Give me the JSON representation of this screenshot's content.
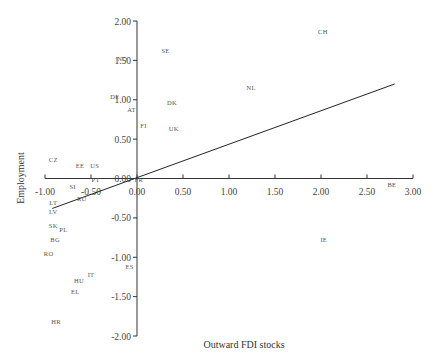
{
  "chart_data": {
    "type": "scatter",
    "title": "",
    "xlabel": "Outward FDI stocks",
    "ylabel": "Employment",
    "xlim": [
      -1.0,
      3.0
    ],
    "ylim": [
      -2.0,
      2.0
    ],
    "grid": false,
    "legend": "none",
    "x_ticks": [
      "-1.00",
      "-0.50",
      "0.00",
      "0.50",
      "1.00",
      "1.50",
      "2.00",
      "2.50",
      "3.00"
    ],
    "y_ticks": [
      "2.00",
      "1.50",
      "1.00",
      "0.50",
      "0.00",
      "-0.50",
      "-1.00",
      "-1.50",
      "-2.00"
    ],
    "points": [
      {
        "label": "CH",
        "x": 2.02,
        "y": 1.87
      },
      {
        "label": "SE",
        "x": 0.31,
        "y": 1.62
      },
      {
        "label": "NO",
        "x": -0.16,
        "y": 1.53
      },
      {
        "label": "NL",
        "x": 1.24,
        "y": 1.15
      },
      {
        "label": "DE",
        "x": -0.24,
        "y": 1.04
      },
      {
        "label": "DK",
        "x": 0.38,
        "y": 0.96
      },
      {
        "label": "AT",
        "x": -0.06,
        "y": 0.88
      },
      {
        "label": "FI",
        "x": 0.07,
        "y": 0.67
      },
      {
        "label": "UK",
        "x": 0.4,
        "y": 0.64
      },
      {
        "label": "CZ",
        "x": -0.91,
        "y": 0.24
      },
      {
        "label": "EE",
        "x": -0.62,
        "y": 0.17
      },
      {
        "label": "US",
        "x": -0.46,
        "y": 0.17
      },
      {
        "label": "PT",
        "x": -0.45,
        "y": -0.01
      },
      {
        "label": "FR",
        "x": 0.02,
        "y": -0.01
      },
      {
        "label": "SI",
        "x": -0.7,
        "y": -0.1
      },
      {
        "label": "RU",
        "x": -0.6,
        "y": -0.25
      },
      {
        "label": "LT",
        "x": -0.91,
        "y": -0.3
      },
      {
        "label": "LV",
        "x": -0.91,
        "y": -0.42
      },
      {
        "label": "SK",
        "x": -0.91,
        "y": -0.6
      },
      {
        "label": "PL",
        "x": -0.8,
        "y": -0.65
      },
      {
        "label": "BG",
        "x": -0.89,
        "y": -0.78
      },
      {
        "label": "RO",
        "x": -0.96,
        "y": -0.95
      },
      {
        "label": "IT",
        "x": -0.5,
        "y": -1.22
      },
      {
        "label": "HU",
        "x": -0.63,
        "y": -1.3
      },
      {
        "label": "EL",
        "x": -0.67,
        "y": -1.43
      },
      {
        "label": "ES",
        "x": -0.08,
        "y": -1.12
      },
      {
        "label": "HR",
        "x": -0.88,
        "y": -1.82
      },
      {
        "label": "IE",
        "x": 2.03,
        "y": -0.78
      },
      {
        "label": "BE",
        "x": 2.77,
        "y": -0.07
      }
    ],
    "regression_line": {
      "x0": -0.92,
      "y0": -0.38,
      "x1": 2.8,
      "y1": 1.2
    }
  }
}
